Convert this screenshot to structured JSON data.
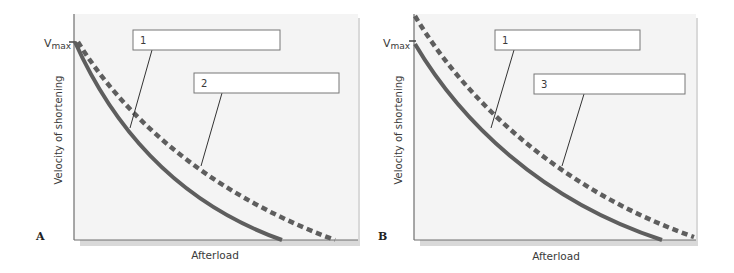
{
  "panels": [
    {
      "id": "A",
      "letter": "A",
      "y_axis_label": "Velocity of shortening",
      "x_axis_label": "Afterload",
      "vmax_label_main": "V",
      "vmax_label_sub": "max",
      "boxes": [
        {
          "label": "1",
          "points_to": "solid-curve"
        },
        {
          "label": "2",
          "points_to": "dashed-curve"
        }
      ],
      "curves": [
        {
          "name": "baseline",
          "style": "solid",
          "description": "Starts at Vmax, intercepts afterload axis earlier"
        },
        {
          "name": "curve-2",
          "style": "dashed",
          "description": "Same Vmax, intercepts afterload axis at higher afterload"
        }
      ]
    },
    {
      "id": "B",
      "letter": "B",
      "y_axis_label": "Velocity of shortening",
      "x_axis_label": "Afterload",
      "vmax_label_main": "V",
      "vmax_label_sub": "max",
      "boxes": [
        {
          "label": "1",
          "points_to": "solid-curve"
        },
        {
          "label": "3",
          "points_to": "dashed-curve"
        }
      ],
      "curves": [
        {
          "name": "baseline",
          "style": "solid",
          "description": "Starts at Vmax"
        },
        {
          "name": "curve-3",
          "style": "dashed",
          "description": "Higher Vmax and higher afterload intercept (shifted up/right)"
        }
      ]
    }
  ],
  "colors": {
    "curve": "#5e5e5e",
    "axis": "#6e6e6e",
    "plot_bg": "#f3f3f3",
    "shadow": "#d8d8d8",
    "box_border": "#777777",
    "text": "#3a3a3a"
  }
}
